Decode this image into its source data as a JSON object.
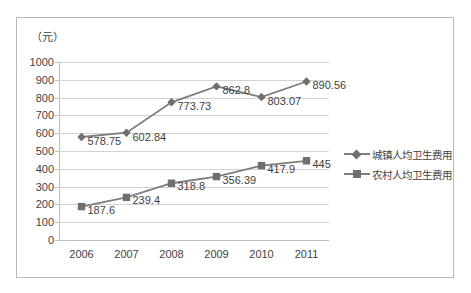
{
  "chart_data": {
    "type": "line",
    "title": "",
    "unit_label": "（元）",
    "xlabel": "",
    "ylabel": "",
    "categories": [
      "2006",
      "2007",
      "2008",
      "2009",
      "2010",
      "2011"
    ],
    "ylim": [
      0,
      1000
    ],
    "ytick_step": 100,
    "yticks": [
      "1000",
      "900",
      "800",
      "700",
      "600",
      "500",
      "400",
      "300",
      "200",
      "100",
      "0"
    ],
    "grid": true,
    "legend_position": "right",
    "series": [
      {
        "name": "城镇人均卫生费用",
        "marker": "diamond",
        "color": "#7d7d7d",
        "values": [
          578.75,
          602.84,
          773.73,
          862.8,
          803.07,
          890.56
        ],
        "labels": [
          "578.75",
          "602.84",
          "773.73",
          "862.8",
          "803.07",
          "890.56"
        ]
      },
      {
        "name": "农村人均卫生费用",
        "marker": "square",
        "color": "#7d7d7d",
        "values": [
          187.6,
          239.4,
          318.8,
          356.39,
          417.9,
          445
        ],
        "labels": [
          "187.6",
          "239.4",
          "318.8",
          "356.39",
          "417.9",
          "445"
        ]
      }
    ]
  },
  "legend": {
    "items": [
      {
        "label": "城镇人均卫生费用"
      },
      {
        "label": "农村人均卫生费用"
      }
    ]
  }
}
